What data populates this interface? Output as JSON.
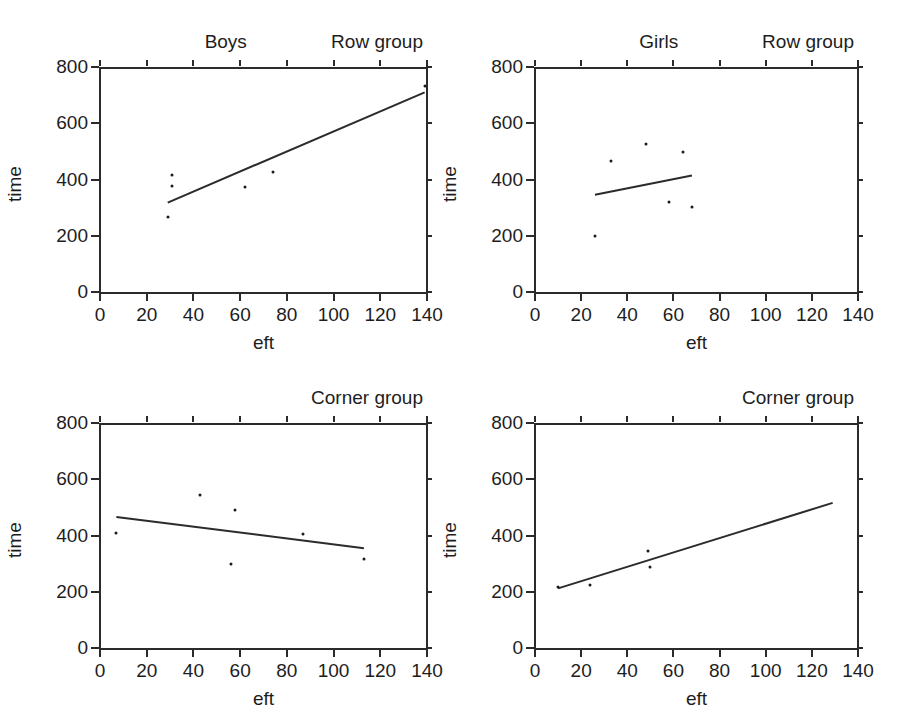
{
  "figure": {
    "width": 906,
    "height": 712,
    "background": "#ffffff",
    "ink_color": "#1a1a1a",
    "panel_count": 4,
    "shared_xlabel": "eft",
    "shared_ylabel": "time"
  },
  "chart_data": [
    {
      "type": "scatter",
      "panel_index": 0,
      "panel_position": "top-left",
      "strip_label_left": "Boys",
      "strip_label_right": "Row group",
      "title": "Boys / Row group",
      "xlabel": "eft",
      "ylabel": "time",
      "xlim": [
        0,
        140
      ],
      "ylim": [
        0,
        800
      ],
      "xticks": [
        0,
        20,
        40,
        60,
        80,
        100,
        120,
        140
      ],
      "xticklabels": [
        "0",
        "20",
        "40",
        "60",
        "80",
        "100",
        "120",
        "140"
      ],
      "yticks": [
        0,
        200,
        400,
        600,
        800
      ],
      "yticklabels": [
        "0",
        "200",
        "400",
        "600",
        "800"
      ],
      "grid": false,
      "legend": "none",
      "points": [
        {
          "x": 31,
          "y": 416
        },
        {
          "x": 31,
          "y": 377
        },
        {
          "x": 29,
          "y": 267
        },
        {
          "x": 62,
          "y": 373
        },
        {
          "x": 74,
          "y": 428
        },
        {
          "x": 139,
          "y": 732
        }
      ],
      "fit_line": {
        "x1": 29,
        "y1": 318,
        "x2": 139,
        "y2": 710,
        "style": "solid"
      }
    },
    {
      "type": "scatter",
      "panel_index": 1,
      "panel_position": "top-right",
      "strip_label_left": "Girls",
      "strip_label_right": "Row group",
      "title": "Girls / Row group",
      "xlabel": "eft",
      "ylabel": "time",
      "xlim": [
        0,
        140
      ],
      "ylim": [
        0,
        800
      ],
      "xticks": [
        0,
        20,
        40,
        60,
        80,
        100,
        120,
        140
      ],
      "xticklabels": [
        "0",
        "20",
        "40",
        "60",
        "80",
        "100",
        "120",
        "140"
      ],
      "yticks": [
        0,
        200,
        400,
        600,
        800
      ],
      "yticklabels": [
        "0",
        "200",
        "400",
        "600",
        "800"
      ],
      "grid": false,
      "legend": "none",
      "points": [
        {
          "x": 26,
          "y": 198
        },
        {
          "x": 33,
          "y": 466
        },
        {
          "x": 48,
          "y": 525
        },
        {
          "x": 58,
          "y": 320
        },
        {
          "x": 64,
          "y": 497
        },
        {
          "x": 68,
          "y": 303
        }
      ],
      "fit_line": {
        "x1": 26,
        "y1": 346,
        "x2": 68,
        "y2": 414,
        "style": "solid"
      }
    },
    {
      "type": "scatter",
      "panel_index": 2,
      "panel_position": "bottom-left",
      "strip_label_left": "",
      "strip_label_right": "Corner group",
      "title": "Corner group",
      "xlabel": "eft",
      "ylabel": "time",
      "xlim": [
        0,
        140
      ],
      "ylim": [
        0,
        800
      ],
      "xticks": [
        0,
        20,
        40,
        60,
        80,
        100,
        120,
        140
      ],
      "xticklabels": [
        "0",
        "20",
        "40",
        "60",
        "80",
        "100",
        "120",
        "140"
      ],
      "yticks": [
        0,
        200,
        400,
        600,
        800
      ],
      "yticklabels": [
        "0",
        "200",
        "400",
        "600",
        "800"
      ],
      "grid": false,
      "legend": "none",
      "points": [
        {
          "x": 7,
          "y": 408
        },
        {
          "x": 43,
          "y": 543
        },
        {
          "x": 56,
          "y": 298
        },
        {
          "x": 58,
          "y": 492
        },
        {
          "x": 87,
          "y": 407
        },
        {
          "x": 113,
          "y": 317
        }
      ],
      "fit_line": {
        "x1": 7,
        "y1": 466,
        "x2": 113,
        "y2": 355,
        "style": "solid"
      }
    },
    {
      "type": "scatter",
      "panel_index": 3,
      "panel_position": "bottom-right",
      "strip_label_left": "",
      "strip_label_right": "Corner group",
      "title": "Corner group",
      "xlabel": "eft",
      "ylabel": "time",
      "xlim": [
        0,
        140
      ],
      "ylim": [
        0,
        800
      ],
      "xticks": [
        0,
        20,
        40,
        60,
        80,
        100,
        120,
        140
      ],
      "xticklabels": [
        "0",
        "20",
        "40",
        "60",
        "80",
        "100",
        "120",
        "140"
      ],
      "yticks": [
        0,
        200,
        400,
        600,
        800
      ],
      "yticklabels": [
        "0",
        "200",
        "400",
        "600",
        "800"
      ],
      "grid": false,
      "legend": "none",
      "points": [
        {
          "x": 10,
          "y": 218
        },
        {
          "x": 24,
          "y": 224
        },
        {
          "x": 49,
          "y": 345
        },
        {
          "x": 50,
          "y": 288
        }
      ],
      "fit_line": {
        "x1": 10,
        "y1": 212,
        "x2": 129,
        "y2": 516,
        "style": "solid"
      }
    }
  ]
}
